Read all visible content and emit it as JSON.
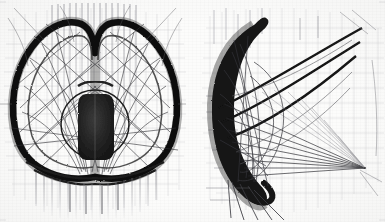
{
  "document": {
    "kind": "scanned-technical-drawing",
    "title": "",
    "caption": "",
    "sheet_width": 385,
    "sheet_height": 222,
    "background_color": "#fcfcfb",
    "ink_color": "#1a1a1a",
    "mid_ink_color": "#4a4a4a",
    "faint_ink_color": "#9a9aa0",
    "grid_color": "#b9b9bf",
    "description": "Two pencil-and-ink views of a shell structure: a symmetric double-lobe front elevation at left and a hooked crescent side view at right, both overlaid with a ruled grid and sheaves of straight construction lines."
  },
  "figures": [
    {
      "id": "figure-left",
      "name": "front-elevation",
      "label": "",
      "bounds": {
        "x": 4,
        "y": 6,
        "width": 182,
        "height": 214
      },
      "notes": "Symmetric twin-lobe outline with a dark rounded core at centre; ruled vertical band above, hanging vertical drop lines below."
    },
    {
      "id": "figure-right",
      "name": "side-section",
      "label": "",
      "bounds": {
        "x": 200,
        "y": 6,
        "width": 182,
        "height": 214
      },
      "notes": "Single thick crescent hook at left with a fan of straight lines converging to a point at lower right."
    }
  ],
  "geometry": {
    "left": {
      "center_x": 95,
      "lobe_left": {
        "outline": "M 95 176 C 66 182 30 172 19 140 C 9 110 14 74 33 48 C 46 30 62 22 76 24 C 86 26 92 36 93 52 L 95 176 Z",
        "inner": "M 93 168 C 70 172 40 162 31 136 C 23 110 28 80 44 58 C 56 41 70 34 81 36 C 88 38 92 46 92 60 Z"
      },
      "lobe_right": {
        "outline": "M 95 176 C 124 182 160 172 171 140 C 181 110 176 74 157 48 C 144 30 128 22 114 24 C 104 26 98 36 97 52 L 95 176 Z",
        "inner": "M 97 168 C 120 172 150 162 159 136 C 167 110 162 80 146 58 C 134 41 120 34 109 36 C 102 38 98 46 98 60 Z"
      },
      "core": {
        "circle": {
          "cx": 95,
          "cy": 124,
          "r": 34
        },
        "block": {
          "x": 78,
          "y": 94,
          "width": 36,
          "height": 66,
          "rx": 7
        }
      },
      "ruled_band": {
        "x_start": 50,
        "x_end": 140,
        "y_top": 4,
        "y_bottom": 120,
        "count": 15,
        "spacing": 6.2
      },
      "drop_lines": {
        "x_start": 34,
        "x_end": 158,
        "y_top": 170,
        "y_bottom": 216,
        "count": 16
      },
      "grid_v": {
        "x_start": 6,
        "x_end": 182,
        "spacing": 11
      },
      "grid_h": {
        "y_start": 16,
        "y_end": 206,
        "spacing": 14
      }
    },
    "right": {
      "crescent": {
        "outer": "M 252 24 C 228 38 212 66 211 104 C 210 144 222 176 244 196 C 252 203 258 205 262 202 C 266 199 265 193 259 186 C 242 166 233 138 234 106 C 235 72 245 46 262 31 C 268 26 269 21 265 19 C 261 17 257 20 252 24 Z",
        "inner_fold": "M 240 188 C 252 200 262 205 268 200 C 272 196 269 190 262 184"
      },
      "vanishing_point": {
        "x": 365,
        "y": 168
      },
      "sweep_curves": [
        "M 220 110 C 262 92 310 60 362 30",
        "M 222 122 C 266 106 312 74 360 44",
        "M 226 136 C 270 122 314 92 358 58"
      ],
      "grid_v": {
        "x_start": 206,
        "x_end": 382,
        "spacing": 12
      },
      "grid_h": {
        "y_start": 16,
        "y_end": 206,
        "spacing": 15
      },
      "drop_lines": {
        "x_start": 230,
        "x_end": 268,
        "y_top": 178,
        "y_bottom": 218,
        "count": 6
      }
    }
  }
}
